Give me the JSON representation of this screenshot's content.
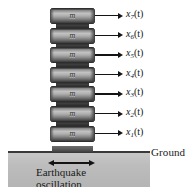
{
  "figure": {
    "type": "multi-degree-of-freedom building model subjected to earthquake ground motion",
    "mass_label": "m",
    "num_stories": 7,
    "ground_label": "Ground",
    "excitation_caption_line1": "Earthquake",
    "excitation_caption_line2": "oscillation",
    "colors": {
      "ground_fill": "#bdbdbd",
      "ground_line": "#3a3a3a",
      "block_dark": "#2a2a2a",
      "block_light": "#c2c2c2",
      "arrow": "#141414",
      "text": "#1a1a1a"
    }
  },
  "stories": [
    {
      "id": "story-7",
      "mass": "m",
      "coordinate_base": "x",
      "coordinate_sub": "7",
      "coordinate_arg": "(t)"
    },
    {
      "id": "story-6",
      "mass": "m",
      "coordinate_base": "x",
      "coordinate_sub": "6",
      "coordinate_arg": "(t)"
    },
    {
      "id": "story-5",
      "mass": "m",
      "coordinate_base": "x",
      "coordinate_sub": "5",
      "coordinate_arg": "(t)"
    },
    {
      "id": "story-4",
      "mass": "m",
      "coordinate_base": "x",
      "coordinate_sub": "4",
      "coordinate_arg": "(t)"
    },
    {
      "id": "story-3",
      "mass": "m",
      "coordinate_base": "x",
      "coordinate_sub": "3",
      "coordinate_arg": "(t)"
    },
    {
      "id": "story-2",
      "mass": "m",
      "coordinate_base": "x",
      "coordinate_sub": "2",
      "coordinate_arg": "(t)"
    },
    {
      "id": "story-1",
      "mass": "m",
      "coordinate_base": "x",
      "coordinate_sub": "1",
      "coordinate_arg": "(t)"
    }
  ]
}
